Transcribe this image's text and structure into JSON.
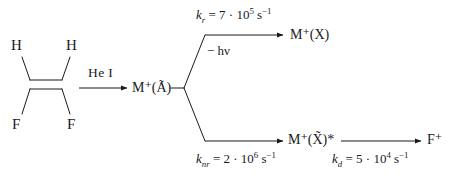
{
  "diagram": {
    "type": "reaction-scheme",
    "ink_color": "#1a1a1a",
    "background_color": "#ffffff"
  },
  "reactant": {
    "name": "1,1-difluoroethylene",
    "formula": "CH2=CF2",
    "atoms": [
      {
        "label": "H",
        "position": "top-left"
      },
      {
        "label": "H",
        "position": "top-right"
      },
      {
        "label": "F",
        "position": "bottom-left"
      },
      {
        "label": "F",
        "position": "bottom-right"
      }
    ],
    "bond": "double"
  },
  "ionization": {
    "reagent_label": "He I",
    "arrow": "right"
  },
  "species": {
    "excited_ion": {
      "symbol": "M",
      "charge": "+",
      "state": "(Ã)",
      "full": "M⁺(Ã)"
    },
    "ground_ion": {
      "symbol": "M",
      "charge": "+",
      "state": "(X)",
      "full": "M⁺(X)"
    },
    "vib_excited_ion": {
      "symbol": "M",
      "charge": "+",
      "state": "(X̃)*",
      "full": "M⁺(X̃)*"
    },
    "fragment_ion": {
      "symbol": "F",
      "charge": "+",
      "full": "F⁺"
    }
  },
  "channels": [
    {
      "name": "radiative",
      "rate_symbol": "k",
      "rate_subscript": "r",
      "coefficient": "7",
      "base": "10",
      "exponent": "5",
      "units": "s",
      "units_exponent": "−1",
      "expression": "k_r = 7 · 10⁵ s⁻¹",
      "annotation": "− hν",
      "product": "M⁺(X)"
    },
    {
      "name": "non-radiative",
      "rate_symbol": "k",
      "rate_subscript": "nr",
      "coefficient": "2",
      "base": "10",
      "exponent": "6",
      "units": "s",
      "units_exponent": "−1",
      "expression": "k_nr = 2 · 10⁶ s⁻¹",
      "annotation": "",
      "product": "M⁺(X̃)*"
    },
    {
      "name": "dissociation",
      "rate_symbol": "k",
      "rate_subscript": "d",
      "coefficient": "5",
      "base": "10",
      "exponent": "4",
      "units": "s",
      "units_exponent": "−1",
      "expression": "k_d = 5 · 10⁴ s⁻¹",
      "annotation": "",
      "product": "F⁺"
    }
  ],
  "symbols": {
    "equals": "=",
    "dot": "·",
    "minus": "−",
    "h": "h",
    "nu": "ν",
    "s": "s"
  }
}
